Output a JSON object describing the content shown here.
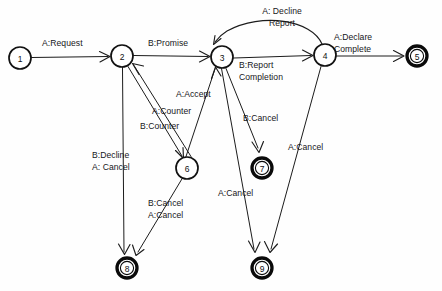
{
  "diagram": {
    "type": "state-transition-diagram",
    "title": "",
    "background_color": "#fefefe",
    "stroke_color": "#1c1c1c",
    "node_fill": "#ffffff",
    "nodes": [
      {
        "id": "1",
        "label": "1",
        "cx": 20,
        "cy": 58,
        "r": 11,
        "style": "normal"
      },
      {
        "id": "2",
        "label": "2",
        "cx": 122,
        "cy": 56,
        "r": 11,
        "style": "normal"
      },
      {
        "id": "3",
        "label": "3",
        "cx": 222,
        "cy": 57,
        "r": 11,
        "style": "normal"
      },
      {
        "id": "4",
        "label": "4",
        "cx": 325,
        "cy": 55,
        "r": 11,
        "style": "normal"
      },
      {
        "id": "5",
        "label": "5",
        "cx": 417,
        "cy": 56,
        "r": 10.5,
        "style": "final"
      },
      {
        "id": "6",
        "label": "6",
        "cx": 187,
        "cy": 168,
        "r": 11,
        "style": "normal"
      },
      {
        "id": "7",
        "label": "7",
        "cx": 262,
        "cy": 168,
        "r": 10.5,
        "style": "final"
      },
      {
        "id": "8",
        "label": "8",
        "cx": 127,
        "cy": 268,
        "r": 10.5,
        "style": "final"
      },
      {
        "id": "9",
        "label": "9",
        "cx": 262,
        "cy": 268,
        "r": 10.5,
        "style": "final"
      }
    ],
    "edges": [
      {
        "id": "e1",
        "from": "1",
        "to": "2",
        "label": "A:Request",
        "label_x": 42,
        "label_y": 38,
        "align": "left"
      },
      {
        "id": "e2",
        "from": "2",
        "to": "3",
        "label": "B:Promise",
        "label_x": 148,
        "label_y": 38,
        "align": "left"
      },
      {
        "id": "e3",
        "from": "3",
        "to": "4",
        "label": "B:Report\nCompletion",
        "label_x": 239,
        "label_y": 60,
        "align": "left"
      },
      {
        "id": "e4",
        "from": "4",
        "to": "3",
        "label": "A: Decline\nReport",
        "label_x": 243,
        "label_y": 6,
        "align": "center"
      },
      {
        "id": "e5",
        "from": "4",
        "to": "5",
        "label": "A:Declare\nComplete",
        "label_x": 334,
        "label_y": 32,
        "align": "left"
      },
      {
        "id": "e6",
        "from": "2",
        "to": "6",
        "label": "B:Counter",
        "label_x": 140,
        "label_y": 121,
        "align": "left"
      },
      {
        "id": "e7",
        "from": "6",
        "to": "2",
        "label": "A:Counter",
        "label_x": 152,
        "label_y": 106,
        "align": "left"
      },
      {
        "id": "e8",
        "from": "6",
        "to": "3",
        "label": "A:Accept",
        "label_x": 176,
        "label_y": 89,
        "align": "left"
      },
      {
        "id": "e9",
        "from": "2",
        "to": "8",
        "label": "B:Decline\nA: Cancel",
        "label_x": 92,
        "label_y": 150,
        "align": "left"
      },
      {
        "id": "e10",
        "from": "6",
        "to": "8",
        "label": "B:Cancel\nA:Cancel",
        "label_x": 148,
        "label_y": 198,
        "align": "left"
      },
      {
        "id": "e11",
        "from": "3",
        "to": "7",
        "label": "B:Cancel",
        "label_x": 243,
        "label_y": 113,
        "align": "left"
      },
      {
        "id": "e12",
        "from": "3",
        "to": "9",
        "label": "A:Cancel",
        "label_x": 218,
        "label_y": 188,
        "align": "left"
      },
      {
        "id": "e13",
        "from": "4",
        "to": "9",
        "label": "A:Cancel",
        "label_x": 288,
        "label_y": 142,
        "align": "left"
      }
    ]
  }
}
